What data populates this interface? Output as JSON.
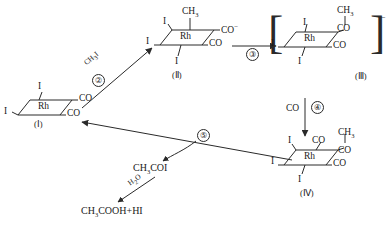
{
  "diagram": {
    "metal": "Rh",
    "structures": [
      {
        "id": "I",
        "label": "(Ⅰ)",
        "ligands": {
          "top": "I",
          "left": "I",
          "upper_right": "CO",
          "lower_right": "CO"
        }
      },
      {
        "id": "II",
        "label": "(Ⅱ)",
        "ligands": {
          "top": "CH",
          "top_sub": "3",
          "upper_left": "I",
          "left": "I",
          "bottom": "I",
          "upper_right": "CO",
          "upper_right_sup": "−",
          "lower_right": "CO"
        }
      },
      {
        "id": "III",
        "label": "(Ⅲ)",
        "charge": "−",
        "ligands": {
          "top": "CH",
          "top_sub": "3",
          "acyl": "CO",
          "upper_left": "I",
          "left": "I",
          "bottom": "I",
          "lower_right": "CO"
        }
      },
      {
        "id": "IV",
        "label": "(Ⅳ)",
        "ligands": {
          "top": "CO",
          "methyl": "CH",
          "methyl_sub": "3",
          "methyl_sup": "−",
          "acyl": "CO",
          "upper_left": "I",
          "left": "I",
          "bottom": "I",
          "lower_right": "CO"
        }
      }
    ],
    "steps": [
      {
        "number": "②",
        "reagent": "CH",
        "reagent_sub": "3",
        "reagent_tail": "I",
        "from": "I",
        "to": "II"
      },
      {
        "number": "③",
        "reagent": "",
        "from": "II",
        "to": "III"
      },
      {
        "number": "④",
        "reagent": "CO",
        "from": "III",
        "to": "IV"
      },
      {
        "number": "⑤",
        "reagent": "",
        "from": "IV",
        "to": "I"
      }
    ],
    "products": {
      "acetyl_iodide": {
        "main": "CH",
        "sub": "3",
        "tail": "COI"
      },
      "hydrolysis_reagent": {
        "main": "H",
        "sub": "2",
        "tail": "O"
      },
      "acetic_acid": {
        "main": "CH",
        "sub": "3",
        "tail": "COOH+HI"
      }
    },
    "colors": {
      "line": "#2a2a2a",
      "text": "#1a1a1a",
      "background": "#ffffff"
    }
  }
}
